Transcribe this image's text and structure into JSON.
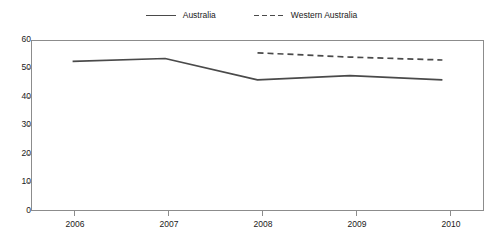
{
  "chart_data": {
    "type": "line",
    "title": "",
    "subtitle": "",
    "xlabel": "",
    "ylabel": "",
    "categories": [
      "2006",
      "2007",
      "2008",
      "2009",
      "2010"
    ],
    "x": [
      2006,
      2007,
      2008,
      2009,
      2010
    ],
    "xlim": [
      2005.55,
      2010.45
    ],
    "ylim": [
      0,
      60
    ],
    "yticks": [
      0,
      10,
      20,
      30,
      40,
      50,
      60
    ],
    "xticks": [
      "2006",
      "2007",
      "2008",
      "2009",
      "2010"
    ],
    "grid": false,
    "legend_position": "top-center",
    "series": [
      {
        "name": "Australia",
        "style": "solid",
        "color": "#4a4a4a",
        "values": [
          52.5,
          53.5,
          46.0,
          47.5,
          46.0
        ]
      },
      {
        "name": "Western Australia",
        "style": "dashed",
        "color": "#4a4a4a",
        "values": [
          null,
          null,
          55.5,
          54.0,
          53.0
        ]
      }
    ]
  },
  "legend": {
    "entries": [
      {
        "label": "Australia",
        "swatch": "solid-line-swatch"
      },
      {
        "label": "Western Australia",
        "swatch": "dashed-line-swatch"
      }
    ]
  },
  "axes": {
    "y": {
      "labels": [
        "60",
        "50",
        "40",
        "30",
        "20",
        "10",
        "0"
      ]
    },
    "x": {
      "labels": [
        "2006",
        "2007",
        "2008",
        "2009",
        "2010"
      ]
    }
  }
}
